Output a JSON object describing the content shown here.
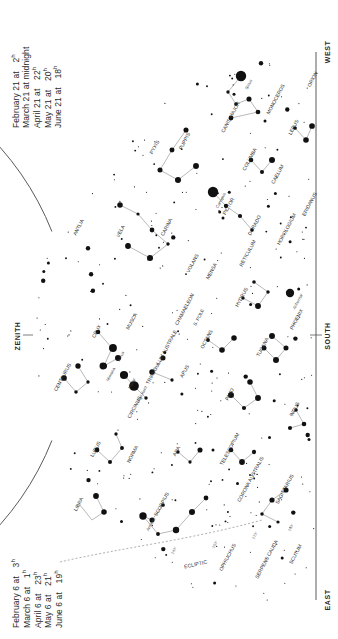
{
  "meta": {
    "width": 338,
    "height": 639,
    "colors": {
      "ink": "#1a1a1a",
      "line": "#8d8d8d",
      "horizon": "#555555",
      "ecliptic": "#9a9a9a",
      "background": "#ffffff"
    }
  },
  "legend_top": {
    "rows": [
      {
        "date": "February 21 at",
        "time": "2",
        "unit": "h"
      },
      {
        "date": "March 21 at midnight",
        "time": "",
        "unit": ""
      },
      {
        "date": "April 21 at",
        "time": "22",
        "unit": "h"
      },
      {
        "date": "May 21 at",
        "time": "20",
        "unit": "h"
      },
      {
        "date": "June 21 at",
        "time": "18",
        "unit": "h"
      }
    ]
  },
  "legend_bottom": {
    "rows": [
      {
        "date": "February 6 at",
        "time": "3",
        "unit": "h"
      },
      {
        "date": "March 6 at",
        "time": "1",
        "unit": "h"
      },
      {
        "date": "April 6 at",
        "time": "23",
        "unit": "h"
      },
      {
        "date": "May 6 at",
        "time": "21",
        "unit": "h"
      },
      {
        "date": "June 6 at",
        "time": "19",
        "unit": "h"
      }
    ]
  },
  "compass": {
    "west": "WEST",
    "east": "EAST",
    "south": "SOUTH",
    "zenith": "ZENITH"
  },
  "ecliptic": {
    "label": "ECLIPTIC",
    "degree_marks": [
      "240°",
      "250°",
      "270°",
      "280°"
    ]
  },
  "pole_label": "S. POLE",
  "chart_data": {
    "type": "scatter",
    "projection": "horizon dome, south meridian at right edge",
    "constellations": [
      {
        "name": "PYXIS",
        "x": 156,
        "y": 148,
        "rot": -62
      },
      {
        "name": "PUPPIS",
        "x": 186,
        "y": 142,
        "rot": -62
      },
      {
        "name": "CANIS MAJOR",
        "x": 232,
        "y": 118,
        "rot": -62
      },
      {
        "name": "MONOCEROS",
        "x": 277,
        "y": 100,
        "rot": -62
      },
      {
        "name": "ORION",
        "x": 314,
        "y": 80,
        "rot": -62
      },
      {
        "name": "LEPUS",
        "x": 295,
        "y": 128,
        "rot": -62
      },
      {
        "name": "COLUMBA",
        "x": 251,
        "y": 160,
        "rot": -62
      },
      {
        "name": "CAELUM",
        "x": 279,
        "y": 175,
        "rot": -62
      },
      {
        "name": "ERIDANUS",
        "x": 311,
        "y": 205,
        "rot": -62
      },
      {
        "name": "ANTLIA",
        "x": 80,
        "y": 228,
        "rot": -62
      },
      {
        "name": "VELA",
        "x": 122,
        "y": 232,
        "rot": -62
      },
      {
        "name": "CARINA",
        "x": 168,
        "y": 228,
        "rot": -62
      },
      {
        "name": "PICTOR",
        "x": 230,
        "y": 207,
        "rot": -62
      },
      {
        "name": "DORADO",
        "x": 256,
        "y": 226,
        "rot": -62
      },
      {
        "name": "HOROLOGIUM",
        "x": 288,
        "y": 230,
        "rot": -62
      },
      {
        "name": "VOLANS",
        "x": 194,
        "y": 264,
        "rot": -62
      },
      {
        "name": "MENSA",
        "x": 213,
        "y": 272,
        "rot": -62
      },
      {
        "name": "RETICULUM",
        "x": 249,
        "y": 254,
        "rot": -62
      },
      {
        "name": "CHAMAELEON",
        "x": 186,
        "y": 310,
        "rot": -62
      },
      {
        "name": "HYDRUS",
        "x": 243,
        "y": 298,
        "rot": -62
      },
      {
        "name": "PHOENIX",
        "x": 298,
        "y": 320,
        "rot": -62
      },
      {
        "name": "CRUX",
        "x": 98,
        "y": 332,
        "rot": -62
      },
      {
        "name": "MUSCA",
        "x": 133,
        "y": 322,
        "rot": -62
      },
      {
        "name": "OCTANS",
        "x": 208,
        "y": 340,
        "rot": -62
      },
      {
        "name": "TUCANA",
        "x": 264,
        "y": 348,
        "rot": -62
      },
      {
        "name": "CENTAURUS",
        "x": 64,
        "y": 378,
        "rot": -62
      },
      {
        "name": "TRIANGULUM AUSTRALE",
        "x": 163,
        "y": 358,
        "rot": -62
      },
      {
        "name": "APUS",
        "x": 186,
        "y": 372,
        "rot": -62
      },
      {
        "name": "CIRCINUS",
        "x": 136,
        "y": 408,
        "rot": -62
      },
      {
        "name": "PAVO",
        "x": 231,
        "y": 395,
        "rot": -62
      },
      {
        "name": "INDUS",
        "x": 296,
        "y": 410,
        "rot": -62
      },
      {
        "name": "LUPUS",
        "x": 97,
        "y": 450,
        "rot": -62
      },
      {
        "name": "NORMA",
        "x": 134,
        "y": 455,
        "rot": -62
      },
      {
        "name": "ARA",
        "x": 178,
        "y": 452,
        "rot": -62
      },
      {
        "name": "TELESCOPIUM",
        "x": 231,
        "y": 450,
        "rot": -62
      },
      {
        "name": "LIBRA",
        "x": 80,
        "y": 505,
        "rot": -62
      },
      {
        "name": "SCORPIUS",
        "x": 163,
        "y": 505,
        "rot": -62
      },
      {
        "name": "CORONA AUSTRALIS",
        "x": 252,
        "y": 480,
        "rot": -62
      },
      {
        "name": "SAGITTARIUS",
        "x": 286,
        "y": 490,
        "rot": -62
      },
      {
        "name": "OPHIUCHUS",
        "x": 229,
        "y": 558,
        "rot": -62
      },
      {
        "name": "SERPENS CAUDA",
        "x": 268,
        "y": 560,
        "rot": -62
      },
      {
        "name": "SCUTUM",
        "x": 297,
        "y": 555,
        "rot": -62
      }
    ],
    "named_stars": [
      {
        "name": "Sirius",
        "x": 241,
        "y": 76,
        "mag": -1.5,
        "rot": -62
      },
      {
        "name": "Canopus",
        "x": 213,
        "y": 192,
        "mag": -0.7,
        "rot": -62
      },
      {
        "name": "Achernar",
        "x": 290,
        "y": 293,
        "mag": 0.5,
        "rot": -62
      },
      {
        "name": "Acrux",
        "x": 113,
        "y": 348,
        "mag": 0.8,
        "rot": -62
      },
      {
        "name": "Mimosa",
        "x": 103,
        "y": 366,
        "mag": 1.3,
        "rot": -62
      },
      {
        "name": "Hadar",
        "x": 124,
        "y": 375,
        "mag": 0.6,
        "rot": -62
      },
      {
        "name": "Rigil Kent",
        "x": 134,
        "y": 386,
        "mag": -0.3,
        "rot": -62
      },
      {
        "name": "Antares",
        "x": 143,
        "y": 516,
        "mag": 1.0,
        "rot": -62
      }
    ]
  }
}
